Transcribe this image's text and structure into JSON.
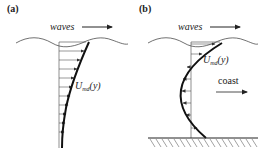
{
  "panels": [
    {
      "id": "a",
      "label": "(a)",
      "waves_label": "waves",
      "profile_label": {
        "symbol": "U",
        "subscript": "md",
        "arg": "(y)"
      }
    },
    {
      "id": "b",
      "label": "(b)",
      "waves_label": "waves",
      "profile_label": {
        "symbol": "U",
        "subscript": "md",
        "arg": "(y)"
      },
      "coast_label": "coast"
    }
  ],
  "colors": {
    "ink": "#222222",
    "background": "#ffffff"
  }
}
